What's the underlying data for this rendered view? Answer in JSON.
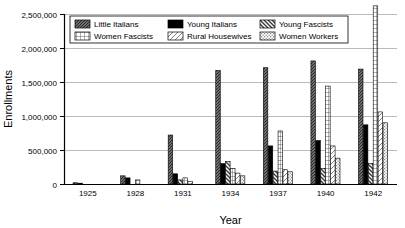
{
  "chart_data": {
    "type": "bar",
    "title": "",
    "xlabel": "Year",
    "ylabel": "Enrollments",
    "categories": [
      "1925",
      "1928",
      "1931",
      "1934",
      "1937",
      "1940",
      "1942"
    ],
    "ylim": [
      0,
      2500000
    ],
    "ytick_labels": [
      "0",
      "500,000",
      "1,000,000",
      "1,500,000",
      "2,000,000",
      "2,500,000"
    ],
    "ytick_values": [
      0,
      500000,
      1000000,
      1500000,
      2000000,
      2500000
    ],
    "grid": true,
    "legend_position": "top-inside",
    "note_clipped": "Women Fascists 1942 bar extends above the 2,500,000 axis maximum",
    "series": [
      {
        "name": "Little Italians",
        "pattern": "dense-diagonal-hatch",
        "color": "#2b2b2b",
        "values": [
          18000,
          120000,
          720000,
          1670000,
          1710000,
          1810000,
          1690000
        ]
      },
      {
        "name": "Young Italians",
        "pattern": "solid-black",
        "color": "#000000",
        "values": [
          12000,
          90000,
          150000,
          300000,
          560000,
          640000,
          870000
        ]
      },
      {
        "name": "Young Fascists",
        "pattern": "back-diagonal-hatch",
        "color": "#3a3a3a",
        "values": [
          0,
          0,
          60000,
          330000,
          190000,
          230000,
          300000
        ]
      },
      {
        "name": "Women Fascists",
        "pattern": "grid-crosshatch",
        "color": "#555555",
        "values": [
          0,
          60000,
          90000,
          230000,
          780000,
          1440000,
          2620000
        ]
      },
      {
        "name": "Rural Housewives",
        "pattern": "sparse-diagonal-hatch",
        "color": "#777777",
        "values": [
          0,
          0,
          40000,
          160000,
          210000,
          560000,
          1060000
        ]
      },
      {
        "name": "Women Workers",
        "pattern": "fine-stipple",
        "color": "#8a8a8a",
        "values": [
          0,
          0,
          0,
          120000,
          180000,
          380000,
          900000
        ]
      }
    ]
  },
  "legend": {
    "entries": [
      {
        "label": "Little Italians"
      },
      {
        "label": "Young Italians"
      },
      {
        "label": "Young Fascists"
      },
      {
        "label": "Women Fascists"
      },
      {
        "label": "Rural Housewives"
      },
      {
        "label": "Women Workers"
      }
    ]
  }
}
